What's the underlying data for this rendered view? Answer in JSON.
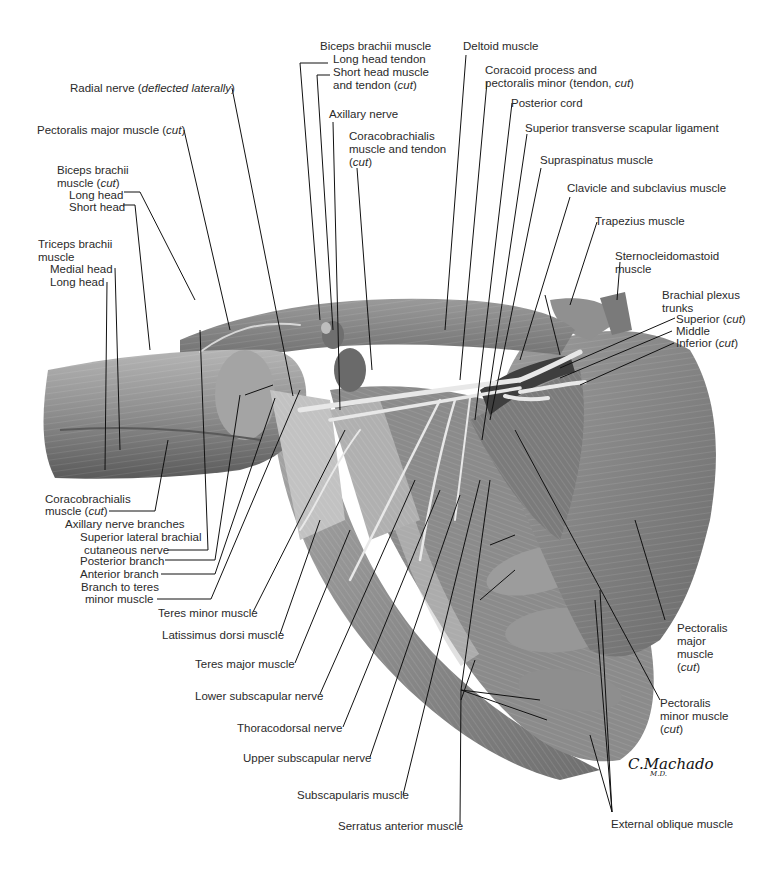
{
  "figure": {
    "signature": "C.Machado",
    "signature_suffix": "M.D."
  },
  "labels": {
    "biceps_brachii_muscle_top": "Biceps brachii muscle",
    "long_head_tendon": "Long head tendon",
    "short_head_muscle_1": "Short head muscle",
    "short_head_muscle_2": "and tendon (",
    "deltoid": "Deltoid muscle",
    "coracoid_1": "Coracoid process and",
    "coracoid_2": "pectoralis minor (tendon, ",
    "radial_nerve": "Radial nerve (",
    "radial_nerve_italic": "deflected laterally",
    "posterior_cord": "Posterior cord",
    "axillary_nerve": "Axillary nerve",
    "sup_transverse": "Superior transverse  scapular ligament",
    "pec_major_cut": "Pectoralis major muscle (",
    "coracobrachialis_top_1": "Coracobrachialis",
    "coracobrachialis_top_2": "muscle and tendon",
    "supraspinatus": "Supraspinatus muscle",
    "biceps_cut_1": "Biceps brachii",
    "biceps_cut_2": "muscle (",
    "biceps_long_head": "Long head",
    "biceps_short_head": "Short head",
    "clavicle": "Clavicle and subclavius muscle",
    "trapezius": "Trapezius muscle",
    "triceps_1": "Triceps brachii",
    "triceps_2": "muscle",
    "triceps_medial": "Medial head",
    "triceps_long": "Long head",
    "scm_1": "Sternocleidomastoid",
    "scm_2": "muscle",
    "bp_1": "Brachial plexus",
    "bp_2": "trunks",
    "bp_superior": "Superior (",
    "bp_middle": "Middle",
    "bp_inferior": "Inferior (",
    "coracobrachialis_bottom_1": "Coracobrachialis",
    "coracobrachialis_bottom_2": "muscle (",
    "axillary_branches": "Axillary nerve branches",
    "sup_lat_brachial_1": "Superior lateral brachial",
    "sup_lat_brachial_2": "cutaneous nerve",
    "posterior_branch": "Posterior branch",
    "anterior_branch": "Anterior branch",
    "branch_teres_1": "Branch to teres",
    "branch_teres_2": "minor muscle",
    "teres_minor": "Teres minor muscle",
    "latissimus": "Latissimus dorsi muscle",
    "teres_major": "Teres major muscle",
    "lower_subscap": "Lower subscapular nerve",
    "thoracodorsal": "Thoracodorsal nerve",
    "upper_subscap": "Upper subscapular nerve",
    "subscapularis": "Subscapularis muscle",
    "serratus": "Serratus anterior muscle",
    "pec_major_r_1": "Pectoralis",
    "pec_major_r_2": "major",
    "pec_major_r_3": "muscle",
    "pec_minor_r_1": "Pectoralis",
    "pec_minor_r_2": "minor muscle",
    "external_oblique": "External oblique muscle",
    "cut": "cut",
    "close_paren": ")"
  },
  "colors": {
    "background": "#ffffff",
    "muscle_dark": "#5e5e5e",
    "muscle_mid": "#8a8a8a",
    "muscle_light": "#b8b8b8",
    "nerve": "#e6e6e6",
    "leader_line": "#111111",
    "text": "#2a2a2a"
  }
}
